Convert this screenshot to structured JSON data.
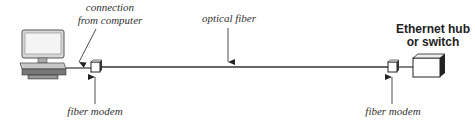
{
  "diagram": {
    "labels": {
      "connection_line1": "connection",
      "connection_line2": "from computer",
      "optical_fiber": "optical fiber",
      "fiber_modem_left": "fiber modem",
      "fiber_modem_right": "fiber modem",
      "hub_line1": "Ethernet hub",
      "hub_line2": "or switch"
    },
    "nodes": [
      "computer",
      "fiber modem",
      "fiber modem",
      "Ethernet hub or switch"
    ],
    "links": [
      {
        "from": "computer",
        "to": "fiber modem",
        "label": "connection from computer"
      },
      {
        "from": "fiber modem",
        "to": "fiber modem",
        "label": "optical fiber"
      },
      {
        "from": "fiber modem",
        "to": "Ethernet hub or switch",
        "label": ""
      }
    ]
  }
}
